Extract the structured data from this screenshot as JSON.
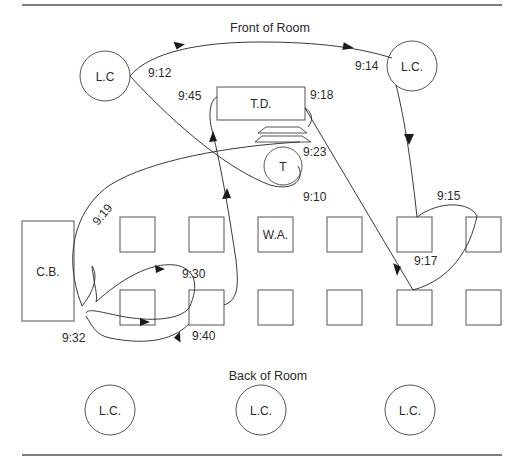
{
  "diagram": {
    "type": "classroom-movement-map",
    "front_label": "Front of Room",
    "back_label": "Back of Room",
    "front_stations": [
      {
        "id": "lc-front-left",
        "label": "L.C"
      },
      {
        "id": "lc-front-right",
        "label": "L.C."
      }
    ],
    "teacher_desk": {
      "label": "T.D."
    },
    "teacher_table": {
      "label": "T"
    },
    "chalkboard": {
      "label": "C.B."
    },
    "desk_rows": [
      {
        "row": 1,
        "desks": [
          "",
          "",
          "W.A.",
          "",
          "",
          ""
        ]
      },
      {
        "row": 2,
        "desks": [
          "",
          "",
          "",
          "",
          "",
          ""
        ]
      }
    ],
    "back_stations": [
      {
        "id": "lc-back-1",
        "label": "L.C."
      },
      {
        "id": "lc-back-2",
        "label": "L.C."
      },
      {
        "id": "lc-back-3",
        "label": "L.C."
      }
    ],
    "timestamps": {
      "t0910": "9:10",
      "t0912": "9:12",
      "t0914": "9:14",
      "t0915": "9:15",
      "t0917": "9:17",
      "t0918": "9:18",
      "t0919": "9:19",
      "t0923": "9:23",
      "t0930": "9:30",
      "t0932": "9:32",
      "t0940": "9:40",
      "t0945": "9:45"
    },
    "path_sequence": [
      "9:10",
      "9:12",
      "9:14",
      "9:15",
      "9:17",
      "9:18",
      "9:19",
      "9:23",
      "9:30",
      "9:32",
      "9:40",
      "9:45"
    ]
  }
}
